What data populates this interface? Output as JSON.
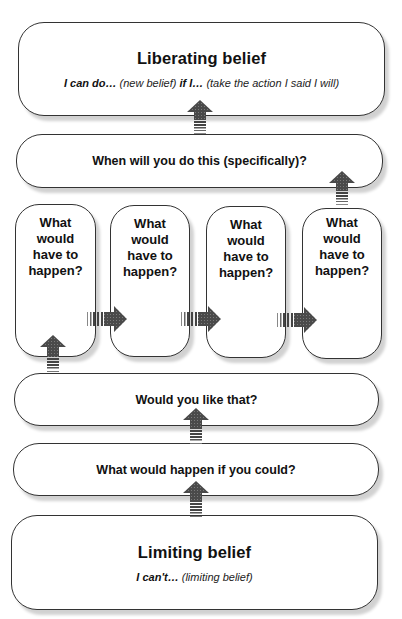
{
  "diagram": {
    "liberating": {
      "title": "Liberating belief",
      "sub_part1": "I can do…",
      "sub_part2": " (new belief) ",
      "sub_part3": "if I…",
      "sub_part4": " (take the action I said I will)"
    },
    "when": {
      "label": "When will you do this (specifically)?"
    },
    "steps": [
      {
        "label": "What would have to happen?"
      },
      {
        "label": "What would have to happen?"
      },
      {
        "label": "What would have to happen?"
      },
      {
        "label": "What would have to happen?"
      }
    ],
    "like": {
      "label": "Would you like that?"
    },
    "could": {
      "label": "What would happen if you could?"
    },
    "limiting": {
      "title": "Limiting belief",
      "sub_part1": "I can't…",
      "sub_part2": " (limiting belief)"
    },
    "arrow_color": "#555555"
  }
}
